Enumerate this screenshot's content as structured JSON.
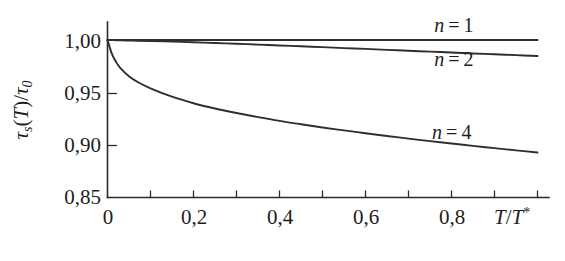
{
  "chart_data": {
    "type": "line",
    "title": "",
    "subtitle": "",
    "xlabel": "T/T*",
    "ylabel": "τs(T)/τ0",
    "xlabel_parts": {
      "base1": "T",
      "slash": "/",
      "base2": "T",
      "sup": "*"
    },
    "ylabel_parts": {
      "tau1": "τ",
      "sub1": "s",
      "paren_open": "(",
      "var": "T",
      "paren_close": ")",
      "slash": "/",
      "tau2": "τ",
      "sub2": "0"
    },
    "xlim": [
      0,
      1.0
    ],
    "ylim": [
      0.85,
      1.0
    ],
    "xticks": [
      0,
      0.1,
      0.2,
      0.3,
      0.4,
      0.5,
      0.6,
      0.7,
      0.8,
      0.9,
      1.0
    ],
    "xtick_labels": [
      "0",
      "",
      "0,2",
      "",
      "0,4",
      "",
      "0,6",
      "",
      "0,8",
      "",
      ""
    ],
    "xtick_labels_shown": [
      "0",
      "0,2",
      "0,4",
      "0,6",
      "0,8"
    ],
    "xtick_labels_shown_at": [
      0,
      0.2,
      0.4,
      0.6,
      0.8
    ],
    "yticks": [
      0.85,
      0.9,
      0.95,
      1.0
    ],
    "ytick_labels": [
      "0,85",
      "0,90",
      "0,95",
      "1,00"
    ],
    "grid": false,
    "legend_position": "inline-annotations",
    "decimal_separator": ",",
    "x": [
      0,
      0.01,
      0.02,
      0.03,
      0.05,
      0.07,
      0.1,
      0.15,
      0.2,
      0.25,
      0.3,
      0.35,
      0.4,
      0.45,
      0.5,
      0.55,
      0.6,
      0.65,
      0.7,
      0.75,
      0.8,
      0.85,
      0.9,
      0.95,
      1.0
    ],
    "series": [
      {
        "name": "n = 1",
        "label": "n=1",
        "label_parts": {
          "var": "n",
          "op": "=",
          "value": "1"
        },
        "color": "#2e2e2e",
        "annotation_at": {
          "x": 0.76,
          "y": 1.008
        },
        "values": [
          1.0,
          1.0,
          1.0,
          1.0,
          1.0,
          1.0,
          1.0,
          1.0,
          1.0,
          1.0,
          1.0,
          1.0,
          1.0,
          1.0,
          1.0,
          1.0,
          1.0,
          1.0,
          1.0,
          1.0,
          1.0,
          1.0,
          1.0,
          1.0,
          1.0
        ]
      },
      {
        "name": "n = 2",
        "label": "n=2",
        "label_parts": {
          "var": "n",
          "op": "=",
          "value": "2"
        },
        "color": "#2e2e2e",
        "annotation_at": {
          "x": 0.76,
          "y": 0.975
        },
        "values": [
          1.0,
          0.9999,
          0.9998,
          0.9997,
          0.9995,
          0.9993,
          0.999,
          0.9985,
          0.9978,
          0.9971,
          0.9964,
          0.9956,
          0.9948,
          0.994,
          0.9932,
          0.9923,
          0.9915,
          0.9906,
          0.9898,
          0.9889,
          0.9881,
          0.9872,
          0.9864,
          0.9856,
          0.9848
        ]
      },
      {
        "name": "n = 4",
        "label": "n=4",
        "label_parts": {
          "var": "n",
          "op": "=",
          "value": "4"
        },
        "color": "#2e2e2e",
        "annotation_at": {
          "x": 0.755,
          "y": 0.9055
        },
        "values": [
          1.0,
          0.987,
          0.979,
          0.9733,
          0.9655,
          0.96,
          0.954,
          0.946,
          0.9398,
          0.9348,
          0.9305,
          0.9266,
          0.923,
          0.9198,
          0.9167,
          0.9139,
          0.9112,
          0.9086,
          0.9061,
          0.9037,
          0.9014,
          0.8992,
          0.897,
          0.8949,
          0.8928
        ]
      }
    ]
  }
}
